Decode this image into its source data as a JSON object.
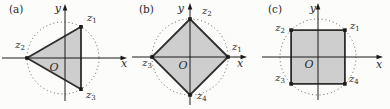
{
  "figure": {
    "background": "#fcfcfa",
    "polygon_fill": "#cecece",
    "polygon_edge": "#2e2e2e",
    "axis_color": "#1a1a1a",
    "circle_color": "#5f5f5f",
    "marker_color": "#1a1a1a",
    "text_color": "#2a2a2a"
  },
  "panels": [
    {
      "tag": "(a)",
      "shape": "inscribed-triangle",
      "center": {
        "x": 63,
        "y": 58
      },
      "radius": 36,
      "x_label": "x",
      "y_label": "y",
      "origin_label": "O",
      "tag_pos": {
        "x": 9,
        "y": 13
      },
      "origin_pos": {
        "x": 54,
        "y": 71
      },
      "x_axis": {
        "x1": 2,
        "x2": 127,
        "y": 58,
        "label_x": 124,
        "label_y": 67
      },
      "y_axis": {
        "y1": 101,
        "y2": 4,
        "x": 65,
        "label_x": 61,
        "label_y": 12
      },
      "vertices": [
        {
          "angle_deg": 60,
          "label": "z",
          "sub": "1",
          "lx": 87,
          "ly": 21,
          "anchor": "start"
        },
        {
          "angle_deg": 180,
          "label": "z",
          "sub": "2",
          "lx": 25,
          "ly": 48,
          "anchor": "end"
        },
        {
          "angle_deg": 300,
          "label": "z",
          "sub": "3",
          "lx": 86,
          "ly": 98,
          "anchor": "start"
        }
      ]
    },
    {
      "tag": "(b)",
      "shape": "inscribed-square-diamond",
      "center": {
        "x": 60,
        "y": 57
      },
      "radius": 38,
      "x_label": "x",
      "y_label": "y",
      "origin_label": "O",
      "tag_pos": {
        "x": 9,
        "y": 13
      },
      "origin_pos": {
        "x": 53,
        "y": 69
      },
      "x_axis": {
        "x1": 2,
        "x2": 117,
        "y": 57,
        "label_x": 110,
        "label_y": 67
      },
      "y_axis": {
        "y1": 105,
        "y2": 3,
        "x": 60,
        "label_x": 54,
        "label_y": 12
      },
      "vertices": [
        {
          "angle_deg": 0,
          "label": "z",
          "sub": "1",
          "lx": 102,
          "ly": 50,
          "anchor": "start"
        },
        {
          "angle_deg": 90,
          "label": "z",
          "sub": "2",
          "lx": 72,
          "ly": 14,
          "anchor": "start"
        },
        {
          "angle_deg": 180,
          "label": "z",
          "sub": "3",
          "lx": 22,
          "ly": 66,
          "anchor": "end"
        },
        {
          "angle_deg": 270,
          "label": "z",
          "sub": "4",
          "lx": 67,
          "ly": 99,
          "anchor": "start"
        }
      ]
    },
    {
      "tag": "(c)",
      "shape": "inscribed-square-axis-aligned",
      "center": {
        "x": 58,
        "y": 57
      },
      "radius": 38,
      "x_label": "x",
      "y_label": "y",
      "origin_label": "O",
      "tag_pos": {
        "x": 8,
        "y": 13
      },
      "origin_pos": {
        "x": 49,
        "y": 68
      },
      "x_axis": {
        "x1": 2,
        "x2": 123,
        "y": 57,
        "label_x": 119,
        "label_y": 68
      },
      "y_axis": {
        "y1": 100,
        "y2": 3,
        "x": 58,
        "label_x": 56,
        "label_y": 12
      },
      "vertices": [
        {
          "angle_deg": 45,
          "label": "z",
          "sub": "1",
          "lx": 90,
          "ly": 29,
          "anchor": "start"
        },
        {
          "angle_deg": 135,
          "label": "z",
          "sub": "2",
          "lx": 25,
          "ly": 31,
          "anchor": "end"
        },
        {
          "angle_deg": 225,
          "label": "z",
          "sub": "3",
          "lx": 25,
          "ly": 81,
          "anchor": "end"
        },
        {
          "angle_deg": 315,
          "label": "z",
          "sub": "4",
          "lx": 89,
          "ly": 82,
          "anchor": "start"
        }
      ]
    }
  ]
}
